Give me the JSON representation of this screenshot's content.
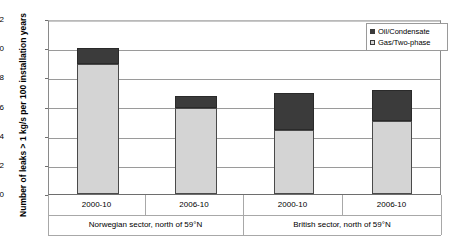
{
  "chart_data": {
    "type": "bar",
    "stacked": true,
    "title": "",
    "xlabel": "",
    "ylabel": "Number of leaks > 1 kg/s per 100 installation years",
    "ylim": [
      0,
      12
    ],
    "yticks": [
      0,
      2,
      4,
      6,
      8,
      10,
      12
    ],
    "grid": true,
    "legend_position": "top-right",
    "categories": [
      "2000-10",
      "2006-10",
      "2000-10",
      "2006-10"
    ],
    "groups": [
      {
        "label": "Norwegian sector, north of 59°N",
        "categories": [
          "2000-10",
          "2006-10"
        ]
      },
      {
        "label": "British sector, north of 59°N",
        "categories": [
          "2000-10",
          "2006-10"
        ]
      }
    ],
    "series": [
      {
        "name": "Gas/Two-phase",
        "color": "#d4d4d4",
        "values": [
          8.9,
          5.9,
          4.4,
          5.0
        ]
      },
      {
        "name": "Oil/Condensate",
        "color": "#3b3b3b",
        "values": [
          1.1,
          0.8,
          2.5,
          2.1
        ]
      }
    ],
    "totals": [
      10.0,
      6.7,
      6.9,
      7.1
    ]
  },
  "legend": {
    "items": [
      {
        "label": "Oil/Condensate",
        "swatch": "oil-swatch"
      },
      {
        "label": "Gas/Two-phase",
        "swatch": "gas-swatch"
      }
    ]
  },
  "axis": {
    "y_title": "Number of leaks > 1 kg/s per 100 installation years",
    "y_tick_labels": [
      "12",
      "10",
      "8",
      "6",
      "4",
      "2",
      "0"
    ]
  }
}
